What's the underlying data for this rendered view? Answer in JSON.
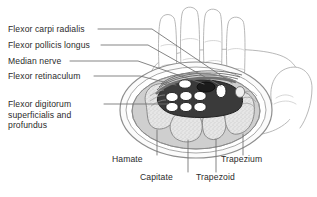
{
  "figure": {
    "kind": "anatomical-cross-section",
    "background_color": "#ffffff",
    "text_color": "#2b2b2b",
    "leader_line_color": "#6f6f6f",
    "skin_outline_color": "#9a9a9a",
    "soft_tissue_fill": "#cfcfcf",
    "bone_fill": "#e2e2e2",
    "tunnel_fill": "#3a3a3a",
    "tendon_fill": "#ffffff",
    "nerve_fill": "#1c1c1c"
  },
  "labels_left": [
    {
      "id": "flexor-carpi-radialis",
      "text": "Flexor carpi radialis"
    },
    {
      "id": "flexor-pollicis-longus",
      "text": "Flexor pollicis longus"
    },
    {
      "id": "median-nerve",
      "text": "Median nerve"
    },
    {
      "id": "flexor-retinaculum",
      "text": "Flexor retinaculum"
    },
    {
      "id": "flexor-digitorum",
      "text": "Flexor digitorum superficialis and profundus"
    }
  ],
  "labels_bottom": [
    {
      "id": "hamate",
      "text": "Hamate"
    },
    {
      "id": "capitate",
      "text": "Capitate"
    },
    {
      "id": "trapezoid",
      "text": "Trapezoid"
    },
    {
      "id": "trapezium",
      "text": "Trapezium"
    }
  ],
  "structures": {
    "carpal_bones": [
      "Hamate",
      "Capitate",
      "Trapezoid",
      "Trapezium"
    ],
    "tunnel_contents": [
      "Flexor digitorum superficialis and profundus tendons",
      "Flexor pollicis longus",
      "Median nerve"
    ],
    "roof": "Flexor retinaculum",
    "outside_tunnel": "Flexor carpi radialis",
    "flexor_digitorum_tendon_count": 6
  }
}
